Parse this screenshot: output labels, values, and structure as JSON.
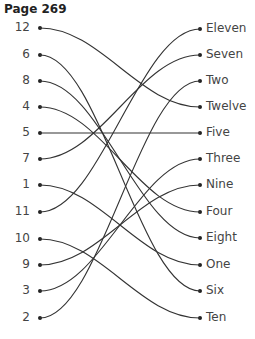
{
  "title": "Page 269",
  "left": [
    {
      "label": "12",
      "y": 28
    },
    {
      "label": "6",
      "y": 55
    },
    {
      "label": "8",
      "y": 81
    },
    {
      "label": "4",
      "y": 107
    },
    {
      "label": "5",
      "y": 133
    },
    {
      "label": "7",
      "y": 159
    },
    {
      "label": "1",
      "y": 185
    },
    {
      "label": "11",
      "y": 212
    },
    {
      "label": "10",
      "y": 239
    },
    {
      "label": "9",
      "y": 265
    },
    {
      "label": "3",
      "y": 291
    },
    {
      "label": "2",
      "y": 318
    }
  ],
  "right": [
    {
      "label": "Eleven",
      "y": 29
    },
    {
      "label": "Seven",
      "y": 55
    },
    {
      "label": "Two",
      "y": 81
    },
    {
      "label": "Twelve",
      "y": 107
    },
    {
      "label": "Five",
      "y": 133
    },
    {
      "label": "Three",
      "y": 159
    },
    {
      "label": "Nine",
      "y": 185
    },
    {
      "label": "Four",
      "y": 212
    },
    {
      "label": "Eight",
      "y": 238
    },
    {
      "label": "One",
      "y": 265
    },
    {
      "label": "Six",
      "y": 291
    },
    {
      "label": "Ten",
      "y": 318
    }
  ],
  "connections": [
    [
      "12",
      "Twelve"
    ],
    [
      "6",
      "Six"
    ],
    [
      "8",
      "Eight"
    ],
    [
      "4",
      "Four"
    ],
    [
      "5",
      "Five"
    ],
    [
      "7",
      "Seven"
    ],
    [
      "1",
      "One"
    ],
    [
      "11",
      "Eleven"
    ],
    [
      "10",
      "Ten"
    ],
    [
      "9",
      "Nine"
    ],
    [
      "3",
      "Three"
    ],
    [
      "2",
      "Two"
    ]
  ]
}
